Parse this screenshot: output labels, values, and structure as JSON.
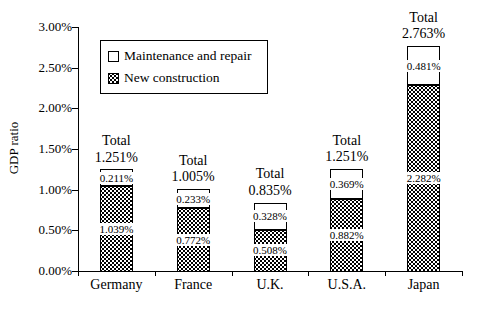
{
  "colors": {
    "background": "#ffffff",
    "text": "#000000",
    "bar_border": "#000000",
    "bar_fill_maintenance": "#ffffff",
    "bar_fill_construction_pattern": "black dots on white"
  },
  "chart_data": {
    "type": "bar",
    "stacked": true,
    "title": "",
    "xlabel": "",
    "ylabel": "GDP ratio",
    "categories": [
      "Germany",
      "France",
      "U.K.",
      "U.S.A.",
      "Japan"
    ],
    "series": [
      {
        "name": "New construction",
        "pattern": "dots",
        "values": [
          1.039,
          0.772,
          0.508,
          0.882,
          2.282
        ],
        "labels": [
          "1.039%",
          "0.772%",
          "0.508%",
          "0.882%",
          "2.282%"
        ]
      },
      {
        "name": "Maintenance and repair",
        "pattern": "plain",
        "values": [
          0.211,
          0.233,
          0.328,
          0.369,
          0.481
        ],
        "labels": [
          "0.211%",
          "0.233%",
          "0.369%",
          "0.369%",
          "0.481%"
        ]
      }
    ],
    "segment_labels": {
      "maintenance": [
        "0.211%",
        "0.233%",
        "0.328%",
        "0.369%",
        "0.481%"
      ],
      "construction": [
        "1.039%",
        "0.772%",
        "0.508%",
        "0.882%",
        "2.282%"
      ]
    },
    "totals": {
      "word": "Total",
      "labels": [
        "1.251%",
        "1.005%",
        "0.835%",
        "1.251%",
        "2.763%"
      ],
      "values": [
        1.251,
        1.005,
        0.835,
        1.251,
        2.763
      ]
    },
    "y_axis": {
      "min": 0,
      "max": 3,
      "step": 0.5,
      "tick_labels": [
        "0.00%",
        "0.50%",
        "1.00%",
        "1.50%",
        "2.00%",
        "2.50%",
        "3.00%"
      ]
    },
    "grid": "off",
    "legend": {
      "position": "upper-left-inside",
      "items": [
        {
          "label": "Maintenance and repair",
          "pattern": "plain"
        },
        {
          "label": "New construction",
          "pattern": "dots"
        }
      ]
    }
  }
}
